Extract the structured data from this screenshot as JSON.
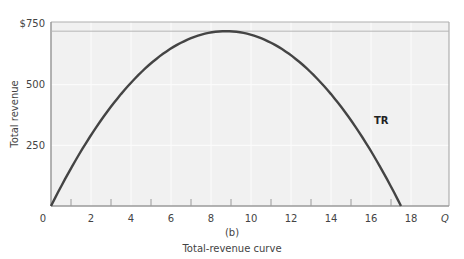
{
  "chart_data": {
    "type": "line",
    "title": "Total-revenue curve",
    "panel_label": "(b)",
    "xlabel": "Q",
    "ylabel": "Total revenue",
    "xlim": [
      0,
      20
    ],
    "ylim": [
      0,
      750
    ],
    "x_ticks": [
      0,
      2,
      4,
      6,
      8,
      10,
      12,
      14,
      16,
      18
    ],
    "x_tick_labels": [
      "0",
      "2",
      "4",
      "6",
      "8",
      "10",
      "12",
      "14",
      "16",
      "18"
    ],
    "y_ticks": [
      250,
      500,
      750
    ],
    "y_tick_labels": [
      "250",
      "500",
      "$750"
    ],
    "grid": true,
    "legend": "none",
    "series": [
      {
        "name": "TR",
        "x": [
          0,
          1,
          2,
          3,
          4,
          5,
          6,
          7,
          8,
          8.75,
          9,
          10,
          11,
          12,
          13,
          14,
          15,
          16,
          17,
          17.5
        ],
        "values": [
          0,
          156,
          293,
          411,
          510,
          590,
          652,
          694,
          718,
          720,
          719,
          710,
          677,
          627,
          556,
          468,
          360,
          234,
          89,
          0
        ]
      }
    ],
    "annotations": [
      {
        "text": "TR",
        "x": 16.4,
        "y": 370
      },
      {
        "type": "hline",
        "y": 720,
        "note": "maximum total revenue reference line"
      }
    ]
  },
  "labels": {
    "y_top": "$750",
    "y_mid": "500",
    "y_low": "250",
    "x_zero": "0",
    "x_axis_var": "Q",
    "y_axis_title": "Total revenue",
    "curve_label": "TR",
    "panel": "(b)",
    "caption": "Total-revenue curve"
  },
  "colors": {
    "plot_bg": "#f1f1f1",
    "grid": "#fbfbfb",
    "frame": "#9a9a9a",
    "curve": "#444444",
    "peak_line": "#b5b5b5"
  }
}
